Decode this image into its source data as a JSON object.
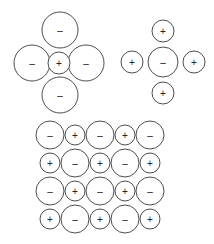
{
  "figure": {
    "background_color": "#ffffff",
    "stroke_color": "#3a3a3a",
    "sign_color": "#262626",
    "plus_sign": "+",
    "minus_sign": "−",
    "width": 214,
    "height": 244
  },
  "clusters": [
    {
      "name": "cation-surrounded-by-anions",
      "label": "Positive ion surrounded by four negative ions",
      "center": {
        "name": "center-cation",
        "sign": "+",
        "charge": "positive",
        "cx": 59,
        "cy": 63,
        "r": 11
      },
      "neighbors": [
        {
          "name": "top-anion",
          "sign": "−",
          "charge": "negative",
          "cx": 60,
          "cy": 30,
          "r": 18
        },
        {
          "name": "left-anion",
          "sign": "−",
          "charge": "negative",
          "cx": 32,
          "cy": 63,
          "r": 18
        },
        {
          "name": "right-anion",
          "sign": "−",
          "charge": "negative",
          "cx": 86,
          "cy": 63,
          "r": 18
        },
        {
          "name": "bottom-anion",
          "sign": "−",
          "charge": "negative",
          "cx": 60,
          "cy": 95,
          "r": 18
        }
      ]
    },
    {
      "name": "anion-surrounded-by-cations",
      "label": "Negative ion surrounded by four positive ions",
      "center": {
        "name": "center-anion",
        "sign": "−",
        "charge": "negative",
        "cx": 163,
        "cy": 62,
        "r": 15
      },
      "neighbors": [
        {
          "name": "top-cation",
          "sign": "+",
          "charge": "positive",
          "cx": 163,
          "cy": 31,
          "r": 11
        },
        {
          "name": "left-cation",
          "sign": "+",
          "charge": "positive",
          "cx": 132,
          "cy": 62,
          "r": 11
        },
        {
          "name": "right-cation",
          "sign": "+",
          "charge": "positive",
          "cx": 194,
          "cy": 62,
          "r": 11
        },
        {
          "name": "bottom-cation",
          "sign": "+",
          "charge": "positive",
          "cx": 163,
          "cy": 93,
          "r": 11
        }
      ]
    }
  ],
  "lattice": {
    "name": "ionic-lattice",
    "label": "Alternating ionic lattice, 4 rows by 5 columns",
    "rows": 4,
    "columns": 5,
    "large_radius": 14,
    "small_radius": 10,
    "origin_x": 50,
    "origin_y": 135,
    "step_x": 25,
    "step_y": 28,
    "grid": [
      [
        "−",
        "+",
        "−",
        "+",
        "−"
      ],
      [
        "+",
        "−",
        "+",
        "−",
        "+"
      ],
      [
        "−",
        "+",
        "−",
        "+",
        "−"
      ],
      [
        "+",
        "−",
        "+",
        "−",
        "+"
      ]
    ]
  }
}
